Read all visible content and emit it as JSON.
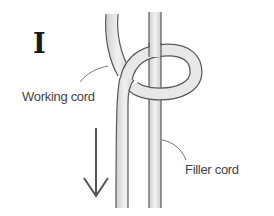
{
  "diagram": {
    "step_label": "I",
    "labels": {
      "working_cord": "Working cord",
      "filler_cord": "Filler cord"
    },
    "arrow_direction": "down",
    "colors": {
      "cord_fill": "#e6e6e6",
      "cord_outline": "#5a5a5a",
      "text": "#444444"
    }
  }
}
